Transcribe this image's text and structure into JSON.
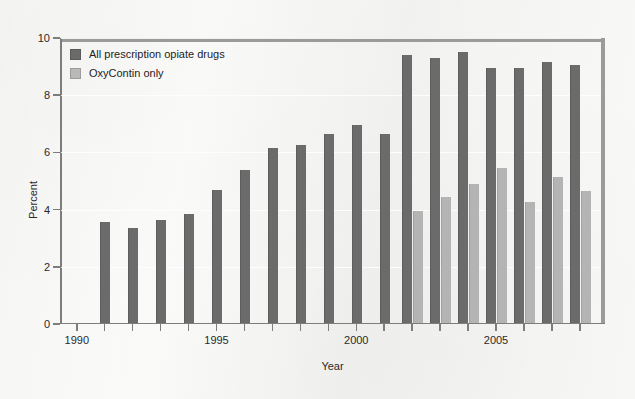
{
  "chart_data": {
    "type": "bar",
    "title": "",
    "xlabel": "Year",
    "ylabel": "Percent",
    "ylim": [
      0,
      10
    ],
    "ytick_values": [
      0,
      2,
      4,
      6,
      8,
      10
    ],
    "ytick_labels": [
      "0",
      "2",
      "4",
      "6",
      "8",
      "10"
    ],
    "xlim": [
      1989.4,
      2008.9
    ],
    "xtick_values": [
      1990,
      1995,
      2000,
      2005
    ],
    "xtick_labels": [
      "1990",
      "1995",
      "2000",
      "2005"
    ],
    "grid": "horizontal",
    "legend_position": "upper left",
    "categories": [
      1990,
      1991,
      1992,
      1993,
      1994,
      1995,
      1996,
      1997,
      1998,
      1999,
      2000,
      2001,
      2002,
      2003,
      2004,
      2005,
      2006,
      2007,
      2008
    ],
    "series": [
      {
        "name": "All prescription opiate drugs",
        "color": "#6b6b6b",
        "values": [
          null,
          3.5,
          3.3,
          3.6,
          3.8,
          4.65,
          5.35,
          6.1,
          6.2,
          6.6,
          6.9,
          6.6,
          9.35,
          9.25,
          9.45,
          8.9,
          8.9,
          9.1,
          9.0
        ]
      },
      {
        "name": "OxyContin only",
        "color": "#b4b4b4",
        "values": [
          null,
          null,
          null,
          null,
          null,
          null,
          null,
          null,
          null,
          null,
          null,
          null,
          3.9,
          4.4,
          4.85,
          5.4,
          4.2,
          5.1,
          4.6
        ]
      }
    ]
  },
  "legend": {
    "items": [
      {
        "label": "All prescription opiate drugs",
        "key": "all"
      },
      {
        "label": "OxyContin only",
        "key": "oxy"
      }
    ]
  },
  "axes": {
    "y_title": "Percent",
    "x_title": "Year"
  }
}
